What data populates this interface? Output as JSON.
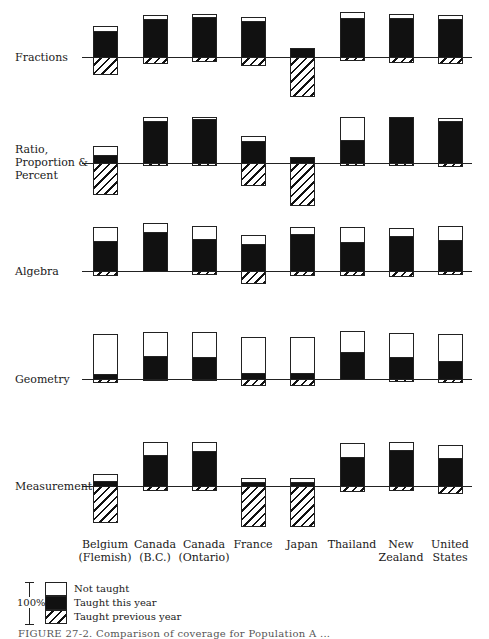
{
  "chart_data": {
    "type": "bar",
    "subtype": "stacked-diverging (percent of students, centered at baseline)",
    "title": "",
    "xlabel": "",
    "ylabel": "",
    "categories": [
      "Belgium (Flemish)",
      "Canada (B.C.)",
      "Canada (Ontario)",
      "France",
      "Japan",
      "Thailand",
      "New Zealand",
      "United States"
    ],
    "category_labels": [
      "Belgium\n(Flemish)",
      "Canada\n(B.C.)",
      "Canada\n(Ontario)",
      "France",
      "Japan",
      "Thailand",
      "New\nZealand",
      "United\nStates"
    ],
    "segments": [
      "Not taught",
      "Taught this year",
      "Taught previous year"
    ],
    "scale_note": "100%",
    "panels": [
      {
        "topic": "Fractions",
        "label": "Fractions",
        "not_taught": [
          11,
          8,
          6,
          8,
          0,
          12,
          8,
          8
        ],
        "taught_this_year": [
          54,
          79,
          84,
          75,
          19,
          81,
          81,
          79
        ],
        "taught_previous_year": [
          35,
          13,
          8,
          17,
          81,
          7,
          11,
          13
        ]
      },
      {
        "topic": "Ratio, Proportion & Percent",
        "label": "Ratio,\nProportion &\nPercent",
        "not_taught": [
          19,
          8,
          4,
          10,
          0,
          48,
          0,
          6
        ],
        "taught_this_year": [
          17,
          87,
          92,
          45,
          12,
          47,
          96,
          88
        ],
        "taught_previous_year": [
          64,
          5,
          4,
          45,
          88,
          5,
          4,
          6
        ]
      },
      {
        "topic": "Algebra",
        "label": "Algebra",
        "not_taught": [
          29,
          19,
          27,
          19,
          15,
          31,
          17,
          29
        ],
        "taught_this_year": [
          63,
          81,
          67,
          56,
          77,
          61,
          73,
          65
        ],
        "taught_previous_year": [
          8,
          0,
          6,
          25,
          8,
          8,
          10,
          6
        ]
      },
      {
        "topic": "Geometry",
        "label": "Geometry",
        "not_taught": [
          83,
          50,
          52,
          75,
          75,
          44,
          50,
          56
        ],
        "taught_this_year": [
          10,
          48,
          46,
          13,
          12,
          56,
          46,
          38
        ],
        "taught_previous_year": [
          7,
          2,
          2,
          12,
          13,
          0,
          4,
          6
        ]
      },
      {
        "topic": "Measurement",
        "label": "Measurement",
        "not_taught": [
          15,
          27,
          19,
          8,
          8,
          29,
          17,
          27
        ],
        "taught_this_year": [
          10,
          65,
          73,
          8,
          8,
          61,
          75,
          58
        ],
        "taught_previous_year": [
          75,
          8,
          8,
          84,
          84,
          10,
          8,
          15
        ]
      }
    ],
    "legend": [
      {
        "label": "Not taught",
        "fill": "#ffffff"
      },
      {
        "label": "Taught this year",
        "fill": "#111111"
      },
      {
        "label": "Taught previous year",
        "fill": "hatched"
      }
    ],
    "legend_position": "bottom-left",
    "grid": false
  },
  "legend": {
    "scale_label": "100%",
    "items": [
      "Not taught",
      "Taught this year",
      "Taught previous year"
    ]
  },
  "caption": "FIGURE 27-2.  Comparison of coverage for Population A ..."
}
